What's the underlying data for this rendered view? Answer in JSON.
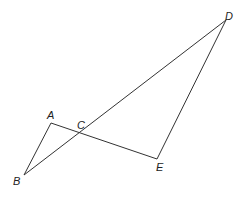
{
  "diagram": {
    "type": "geometry",
    "points": {
      "A": {
        "label": "A",
        "x": 51,
        "y": 123,
        "lx": 47,
        "ly": 119
      },
      "B": {
        "label": "B",
        "x": 24,
        "y": 175,
        "lx": 13,
        "ly": 185
      },
      "C": {
        "label": "C",
        "x": 81,
        "y": 134,
        "lx": 77,
        "ly": 129
      },
      "D": {
        "label": "D",
        "x": 226,
        "y": 20,
        "lx": 225,
        "ly": 20
      },
      "E": {
        "label": "E",
        "x": 157,
        "y": 159,
        "lx": 156,
        "ly": 171
      }
    },
    "segments": [
      {
        "from": "A",
        "to": "B"
      },
      {
        "from": "A",
        "to": "E"
      },
      {
        "from": "B",
        "to": "D"
      },
      {
        "from": "D",
        "to": "E"
      }
    ]
  }
}
